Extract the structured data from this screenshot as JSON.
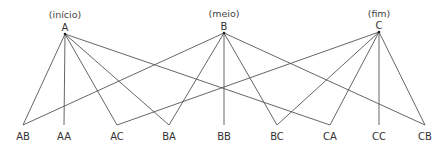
{
  "diagram": {
    "top_nodes": [
      {
        "id": "A",
        "label": "A",
        "note": "(início)",
        "x": 65,
        "y": 34
      },
      {
        "id": "B",
        "label": "B",
        "note": "(meio)",
        "x": 224,
        "y": 33
      },
      {
        "id": "C",
        "label": "C",
        "note": "(fim)",
        "x": 379,
        "y": 32
      }
    ],
    "bottom_nodes": [
      {
        "id": "AB",
        "label": "AB",
        "x": 23
      },
      {
        "id": "AA",
        "label": "AA",
        "x": 64
      },
      {
        "id": "AC",
        "label": "AC",
        "x": 117
      },
      {
        "id": "BA",
        "label": "BA",
        "x": 169
      },
      {
        "id": "BB",
        "label": "BB",
        "x": 224
      },
      {
        "id": "BC",
        "label": "BC",
        "x": 277
      },
      {
        "id": "CA",
        "label": "CA",
        "x": 330
      },
      {
        "id": "CC",
        "label": "CC",
        "x": 379
      },
      {
        "id": "CB",
        "label": "CB",
        "x": 425
      }
    ],
    "bottom_y": 125,
    "edges": [
      [
        "A",
        "AB"
      ],
      [
        "A",
        "AA"
      ],
      [
        "A",
        "AC"
      ],
      [
        "A",
        "BA"
      ],
      [
        "A",
        "CA"
      ],
      [
        "B",
        "AB"
      ],
      [
        "B",
        "BA"
      ],
      [
        "B",
        "BB"
      ],
      [
        "B",
        "BC"
      ],
      [
        "B",
        "CB"
      ],
      [
        "C",
        "AC"
      ],
      [
        "C",
        "BC"
      ],
      [
        "C",
        "CA"
      ],
      [
        "C",
        "CC"
      ],
      [
        "C",
        "CB"
      ]
    ],
    "line_color": "#555555"
  }
}
